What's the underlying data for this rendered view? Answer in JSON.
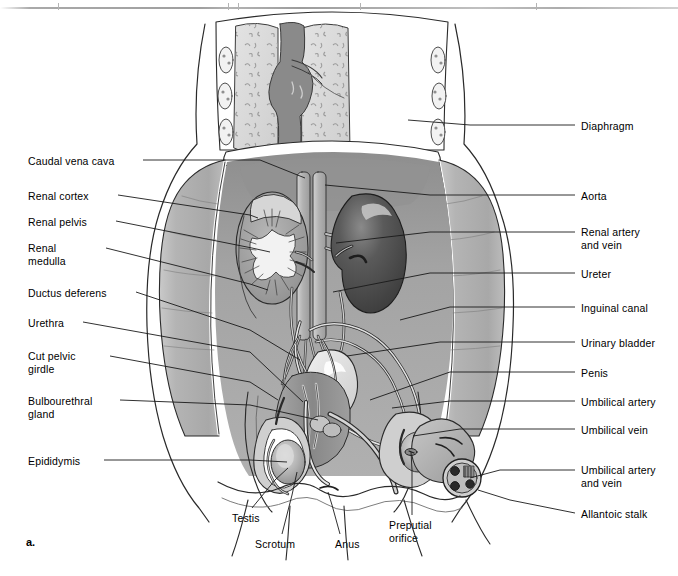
{
  "figure": {
    "marker": "a."
  },
  "labels_left": [
    {
      "id": "caudal-vena-cava",
      "text": "Caudal vena cava",
      "x": 28,
      "y": 155,
      "lines": 1,
      "leader": [
        [
          143,
          160
        ],
        [
          260,
          160
        ],
        [
          305,
          178
        ]
      ]
    },
    {
      "id": "renal-cortex",
      "text": "Renal cortex",
      "x": 28,
      "y": 190,
      "lines": 1,
      "leader": [
        [
          118,
          195
        ],
        [
          250,
          215
        ],
        [
          258,
          218
        ]
      ]
    },
    {
      "id": "renal-pelvis",
      "text": "Renal pelvis",
      "x": 28,
      "y": 216,
      "lines": 1,
      "leader": [
        [
          116,
          221
        ],
        [
          252,
          248
        ],
        [
          270,
          252
        ]
      ]
    },
    {
      "id": "renal-medulla",
      "text": "Renal\nmedulla",
      "x": 28,
      "y": 242,
      "lines": 2,
      "leader": [
        [
          106,
          248
        ],
        [
          250,
          284
        ],
        [
          268,
          290
        ]
      ]
    },
    {
      "id": "ductus-deferens",
      "text": "Ductus deferens",
      "x": 28,
      "y": 287,
      "lines": 1,
      "leader": [
        [
          136,
          292
        ],
        [
          250,
          330
        ],
        [
          300,
          360
        ]
      ]
    },
    {
      "id": "urethra",
      "text": "Urethra",
      "x": 28,
      "y": 317,
      "lines": 1,
      "leader": [
        [
          83,
          322
        ],
        [
          250,
          352
        ],
        [
          303,
          402
        ]
      ]
    },
    {
      "id": "cut-pelvic-girdle",
      "text": "Cut pelvic\ngirdle",
      "x": 28,
      "y": 350,
      "lines": 2,
      "leader": [
        [
          110,
          356
        ],
        [
          250,
          382
        ],
        [
          278,
          400
        ]
      ]
    },
    {
      "id": "bulbourethral-gland",
      "text": "Bulbourethral\ngland",
      "x": 28,
      "y": 395,
      "lines": 2,
      "leader": [
        [
          120,
          400
        ],
        [
          250,
          405
        ],
        [
          318,
          420
        ]
      ]
    },
    {
      "id": "epididymis",
      "text": "Epididymis",
      "x": 28,
      "y": 455,
      "lines": 1,
      "leader": [
        [
          104,
          460
        ],
        [
          250,
          460
        ],
        [
          287,
          462
        ]
      ]
    }
  ],
  "labels_right": [
    {
      "id": "diaphragm",
      "text": "Diaphragm",
      "x": 581,
      "y": 120,
      "lines": 1,
      "leader": [
        [
          575,
          125
        ],
        [
          470,
          125
        ],
        [
          408,
          120
        ]
      ]
    },
    {
      "id": "aorta",
      "text": "Aorta",
      "x": 581,
      "y": 190,
      "lines": 1,
      "leader": [
        [
          575,
          195
        ],
        [
          430,
          195
        ],
        [
          325,
          185
        ]
      ]
    },
    {
      "id": "renal-artery-and-vein",
      "text": "Renal artery\nand vein",
      "x": 581,
      "y": 226,
      "lines": 2,
      "leader": [
        [
          575,
          232
        ],
        [
          430,
          232
        ],
        [
          336,
          243
        ]
      ]
    },
    {
      "id": "ureter",
      "text": "Ureter",
      "x": 581,
      "y": 268,
      "lines": 1,
      "leader": [
        [
          575,
          273
        ],
        [
          430,
          273
        ],
        [
          333,
          292
        ]
      ]
    },
    {
      "id": "inguinal-canal",
      "text": "Inguinal canal",
      "x": 581,
      "y": 302,
      "lines": 1,
      "leader": [
        [
          575,
          307
        ],
        [
          450,
          307
        ],
        [
          400,
          320
        ]
      ]
    },
    {
      "id": "urinary-bladder",
      "text": "Urinary bladder",
      "x": 581,
      "y": 337,
      "lines": 1,
      "leader": [
        [
          575,
          342
        ],
        [
          440,
          342
        ],
        [
          347,
          356
        ]
      ]
    },
    {
      "id": "penis",
      "text": "Penis",
      "x": 581,
      "y": 367,
      "lines": 1,
      "leader": [
        [
          575,
          372
        ],
        [
          450,
          372
        ],
        [
          370,
          400
        ]
      ]
    },
    {
      "id": "umbilical-artery",
      "text": "Umbilical artery",
      "x": 581,
      "y": 396,
      "lines": 1,
      "leader": [
        [
          575,
          401
        ],
        [
          450,
          401
        ],
        [
          392,
          408
        ]
      ]
    },
    {
      "id": "umbilical-vein",
      "text": "Umbilical vein",
      "x": 581,
      "y": 424,
      "lines": 1,
      "leader": [
        [
          575,
          429
        ],
        [
          460,
          429
        ],
        [
          413,
          436
        ]
      ]
    },
    {
      "id": "umbilical-artery-and-vein",
      "text": "Umbilical artery\nand vein",
      "x": 581,
      "y": 464,
      "lines": 2,
      "leader": [
        [
          575,
          470
        ],
        [
          500,
          470
        ],
        [
          470,
          478
        ]
      ]
    },
    {
      "id": "allantoic-stalk",
      "text": "Allantoic stalk",
      "x": 581,
      "y": 508,
      "lines": 1,
      "leader": [
        [
          575,
          513
        ],
        [
          510,
          500
        ],
        [
          478,
          490
        ]
      ]
    }
  ],
  "labels_bottom": [
    {
      "id": "testis",
      "text": "Testis",
      "x": 232,
      "y": 512,
      "lines": 1,
      "leader": [
        [
          252,
          508
        ],
        [
          275,
          480
        ],
        [
          288,
          468
        ]
      ]
    },
    {
      "id": "scrotum",
      "text": "Scrotum",
      "x": 255,
      "y": 538,
      "lines": 1,
      "leader": [
        [
          282,
          534
        ],
        [
          292,
          495
        ],
        [
          297,
          472
        ]
      ]
    },
    {
      "id": "anus",
      "text": "Anus",
      "x": 335,
      "y": 538,
      "lines": 1,
      "leader": [
        [
          340,
          534
        ],
        [
          332,
          505
        ],
        [
          328,
          492
        ]
      ]
    },
    {
      "id": "preputial-orifice",
      "text": "Preputial\norifice",
      "x": 389,
      "y": 519,
      "lines": 2,
      "leader": [
        [
          412,
          515
        ],
        [
          412,
          470
        ],
        [
          411,
          452
        ]
      ]
    }
  ],
  "palette": {
    "body_wall": "#b2b2b2",
    "body_wall_light": "#c4c4c4",
    "abdominal_cavity": "#a0a0a0",
    "lung": "#d9d9d9",
    "mediastinum": "#8c8c8c",
    "kidney_dark": "#4f4f4f",
    "kidney_cut": "#9c9c9c",
    "renal_pelvis": "#eeeeee",
    "vessel": "#bfbfbf",
    "bladder": "#e2e2e2",
    "muscle_mid": "#8f8f8f",
    "outline": "#1a1a1a",
    "leader": "#1a1a1a",
    "text": "#000000",
    "background": "#ffffff"
  },
  "structures": [
    {
      "name": "thoracic-cavity",
      "note": "lungs flanking central mediastinum, ribs lateral"
    },
    {
      "name": "diaphragm",
      "note": "dome separating thorax from abdomen"
    },
    {
      "name": "left-kidney-cut",
      "note": "sectioned: cortex, medulla, renal pelvis"
    },
    {
      "name": "right-kidney",
      "note": "intact, dark bean-shaped"
    },
    {
      "name": "aorta",
      "note": "central vertical vessel with branches"
    },
    {
      "name": "caudal-vena-cava",
      "note": "central vertical vessel paired with aorta"
    },
    {
      "name": "ureters",
      "note": "paired tubes kidney to bladder"
    },
    {
      "name": "urinary-bladder",
      "note": "pelvic sac"
    },
    {
      "name": "umbilical-cord",
      "note": "cut stump, 3 vessel lumens visible"
    },
    {
      "name": "testes-scrotum",
      "note": "paired, with epididymis coils"
    },
    {
      "name": "penis-prepuce",
      "note": "ventral, ending at preputial orifice"
    }
  ]
}
